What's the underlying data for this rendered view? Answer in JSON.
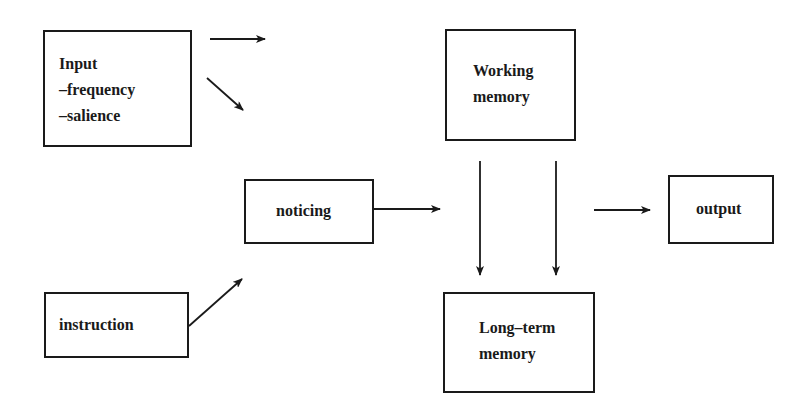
{
  "diagram": {
    "nodes": {
      "input": {
        "title": "Input",
        "lines": [
          "–frequency",
          "–salience"
        ]
      },
      "working_memory": {
        "lines": [
          "Working",
          "memory"
        ]
      },
      "noticing": {
        "label": "noticing"
      },
      "output": {
        "label": "output"
      },
      "instruction": {
        "label": "instruction"
      },
      "long_term_memory": {
        "lines": [
          "Long–term",
          "memory"
        ]
      }
    },
    "edges": [
      {
        "from": "input",
        "to": "working_memory"
      },
      {
        "from": "input",
        "to": "noticing"
      },
      {
        "from": "instruction",
        "to": "noticing"
      },
      {
        "from": "noticing",
        "to": "working_memory"
      },
      {
        "from": "working_memory",
        "to": "long_term_memory"
      },
      {
        "from": "working_memory",
        "to": "long_term_memory"
      },
      {
        "from": "working_memory",
        "to": "output"
      }
    ],
    "colors": {
      "stroke": "#1a1a1a",
      "background": "#ffffff"
    }
  }
}
